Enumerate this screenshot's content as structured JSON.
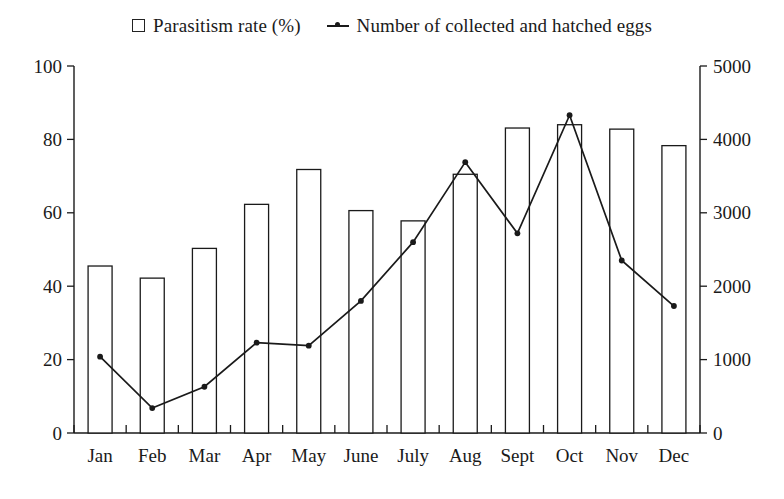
{
  "legend": {
    "entries": [
      {
        "label": "Parasitism rate (%)",
        "marker": "open-square-icon"
      },
      {
        "label": "Number of collected and hatched eggs",
        "marker": "line-with-dot-icon"
      }
    ]
  },
  "axes": {
    "left_ticks": [
      "0",
      "20",
      "40",
      "60",
      "80",
      "100"
    ],
    "right_ticks": [
      "0",
      "1000",
      "2000",
      "3000",
      "4000",
      "5000"
    ]
  },
  "chart_data": {
    "type": "bar",
    "title": "",
    "subtitle": "",
    "xlabel": "",
    "ylabel": "",
    "y2label": "",
    "grid": false,
    "legend_position": "top-center",
    "categories": [
      "Jan",
      "Feb",
      "Mar",
      "Apr",
      "May",
      "June",
      "July",
      "Aug",
      "Sept",
      "Oct",
      "Nov",
      "Dec"
    ],
    "ylim": [
      0,
      100
    ],
    "y2lim": [
      0,
      5000
    ],
    "yticks": [
      0,
      20,
      40,
      60,
      80,
      100
    ],
    "y2ticks": [
      0,
      1000,
      2000,
      3000,
      4000,
      5000
    ],
    "series": [
      {
        "name": "Parasitism rate (%)",
        "type": "bar",
        "axis": "left",
        "values": [
          45.5,
          42.2,
          50.3,
          62.3,
          71.8,
          60.6,
          57.8,
          70.5,
          83.1,
          84.0,
          82.8,
          78.3
        ]
      },
      {
        "name": "Number of collected and hatched eggs",
        "type": "line",
        "axis": "right",
        "values": [
          1040,
          340,
          630,
          1230,
          1190,
          1800,
          2600,
          3690,
          2720,
          4330,
          2350,
          1730
        ]
      }
    ]
  },
  "colors": {
    "ink": "#1a1a1a",
    "bar_fill": "#ffffff",
    "bar_stroke": "#1a1a1a",
    "line_stroke": "#1a1a1a",
    "background": "#ffffff"
  }
}
